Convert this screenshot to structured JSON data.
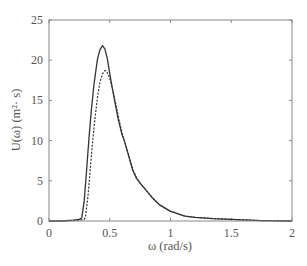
{
  "chart_data": {
    "type": "line",
    "title": "",
    "xlabel": "ω (rad/s)",
    "ylabel": "U(ω) (m²· s)",
    "xlim": [
      0,
      2
    ],
    "ylim": [
      0,
      25
    ],
    "xticks": [
      0,
      0.5,
      1,
      1.5,
      2
    ],
    "xtick_labels": [
      "0",
      "0.5",
      "1",
      "1.5",
      "2"
    ],
    "yticks": [
      0,
      5,
      10,
      15,
      20,
      25
    ],
    "ytick_labels": [
      "0",
      "5",
      "10",
      "15",
      "20",
      "25"
    ],
    "grid": false,
    "legend": null,
    "series": [
      {
        "name": "solid",
        "style": "solid",
        "color": "#333333",
        "x": [
          0,
          0.1,
          0.2,
          0.25,
          0.27,
          0.29,
          0.31,
          0.33,
          0.35,
          0.37,
          0.39,
          0.4,
          0.42,
          0.44,
          0.46,
          0.48,
          0.5,
          0.52,
          0.54,
          0.57,
          0.6,
          0.62,
          0.65,
          0.69,
          0.72,
          0.75,
          0.8,
          0.85,
          0.91,
          1.0,
          1.12,
          1.2,
          1.35,
          1.5,
          1.65,
          1.75,
          2.0
        ],
        "y": [
          0,
          0,
          0.1,
          0.2,
          0.4,
          2.5,
          6.5,
          10.5,
          14,
          17,
          19.2,
          20.2,
          21.3,
          21.8,
          21.4,
          20.2,
          18.3,
          16.6,
          15.0,
          12.6,
          10.8,
          10.0,
          8.4,
          6.3,
          5.3,
          4.7,
          3.8,
          2.9,
          2.0,
          1.2,
          0.6,
          0.45,
          0.3,
          0.2,
          0.1,
          0.05,
          0
        ]
      },
      {
        "name": "dashed",
        "style": "dashed",
        "color": "#333333",
        "x": [
          0,
          0.1,
          0.2,
          0.25,
          0.29,
          0.3,
          0.32,
          0.34,
          0.36,
          0.38,
          0.4,
          0.42,
          0.44,
          0.46,
          0.47,
          0.49,
          0.51,
          0.53,
          0.55,
          0.57,
          0.6,
          0.62,
          0.65,
          0.69,
          0.72,
          0.75,
          0.8,
          0.85,
          0.91,
          1.0,
          1.12,
          1.2,
          1.35,
          1.5,
          1.65,
          1.75,
          2.0
        ],
        "y": [
          0,
          0,
          0.05,
          0.1,
          0.2,
          0.5,
          3.0,
          6.5,
          10,
          13,
          15.5,
          17.3,
          18.3,
          18.7,
          18.7,
          18.2,
          17.2,
          15.9,
          14.5,
          13.0,
          11.0,
          10.0,
          8.5,
          6.4,
          5.4,
          4.7,
          3.8,
          2.9,
          2.0,
          1.2,
          0.6,
          0.45,
          0.3,
          0.2,
          0.1,
          0.05,
          0
        ]
      }
    ]
  },
  "plot_area": {
    "left": 49,
    "right": 292,
    "top": 20,
    "bottom": 221
  },
  "colors": {
    "axis": "#888888",
    "line": "#333333",
    "text": "#555555"
  }
}
